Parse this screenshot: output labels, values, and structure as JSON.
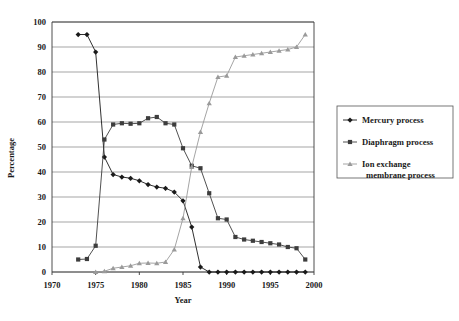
{
  "chart_data": {
    "type": "line",
    "title": "",
    "xlabel": "Year",
    "ylabel": "Percentage",
    "xlim": [
      1970,
      2000
    ],
    "ylim": [
      0,
      100
    ],
    "xticks": [
      1970,
      1975,
      1980,
      1985,
      1990,
      1995,
      2000
    ],
    "yticks": [
      0,
      10,
      20,
      30,
      40,
      50,
      60,
      70,
      80,
      90,
      100
    ],
    "grid": true,
    "legend_position": "right",
    "series": [
      {
        "name": "Mercury process",
        "color": "#1a1a1a",
        "marker": "diamond",
        "x": [
          1973,
          1974,
          1975,
          1976,
          1977,
          1978,
          1979,
          1980,
          1981,
          1982,
          1983,
          1984,
          1985,
          1986,
          1987,
          1988,
          1989,
          1990,
          1991,
          1992,
          1993,
          1994,
          1995,
          1996,
          1997,
          1998,
          1999
        ],
        "y": [
          95,
          95,
          88,
          46,
          39,
          38,
          37.5,
          36.5,
          35,
          34,
          33.5,
          32,
          28.5,
          18,
          2,
          0,
          0,
          0,
          0,
          0,
          0,
          0,
          0,
          0,
          0,
          0,
          0
        ]
      },
      {
        "name": "Diaphragm process",
        "color": "#3d3d3d",
        "marker": "square",
        "x": [
          1973,
          1974,
          1975,
          1976,
          1977,
          1978,
          1979,
          1980,
          1981,
          1982,
          1983,
          1984,
          1985,
          1986,
          1987,
          1988,
          1989,
          1990,
          1991,
          1992,
          1993,
          1994,
          1995,
          1996,
          1997,
          1998,
          1999
        ],
        "y": [
          5,
          5.2,
          10.5,
          53,
          59,
          59.5,
          59.3,
          59.5,
          61.5,
          62,
          59.5,
          59,
          49.5,
          42.5,
          41.5,
          31.5,
          21.5,
          21,
          14,
          13,
          12.5,
          12,
          11.5,
          11,
          10,
          9.5,
          5
        ]
      },
      {
        "name": "Ion exchange membrane process",
        "color": "#9a9a9a",
        "marker": "triangle",
        "x": [
          1975,
          1976,
          1977,
          1978,
          1979,
          1980,
          1981,
          1982,
          1983,
          1984,
          1985,
          1986,
          1987,
          1988,
          1989,
          1990,
          1991,
          1992,
          1993,
          1994,
          1995,
          1996,
          1997,
          1998,
          1999
        ],
        "y": [
          0,
          0.3,
          1.5,
          2,
          2.5,
          3.5,
          3.6,
          3.5,
          4,
          9,
          21.5,
          42,
          56,
          67.5,
          78,
          78.5,
          86,
          86.5,
          87,
          87.5,
          88,
          88.5,
          89,
          90,
          95
        ]
      }
    ]
  },
  "axes": {
    "y_title": "Percentage",
    "x_title": "Year",
    "y_tick_labels": [
      "100",
      "90",
      "80",
      "70",
      "60",
      "50",
      "40",
      "30",
      "20",
      "10",
      "0"
    ],
    "x_tick_labels": [
      "1970",
      "1975",
      "1980",
      "1985",
      "1990",
      "1995",
      "2000"
    ]
  },
  "legend": {
    "items": [
      {
        "label": "Mercury process",
        "color": "#1a1a1a",
        "marker": "diamond"
      },
      {
        "label": "Diaphragm process",
        "color": "#3d3d3d",
        "marker": "square"
      },
      {
        "label": "Ion exchange\nmembrane process",
        "color": "#9a9a9a",
        "marker": "triangle"
      }
    ]
  },
  "caption": {
    "text": ""
  }
}
